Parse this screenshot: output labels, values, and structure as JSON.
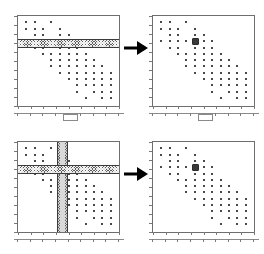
{
  "figure": {
    "title": "",
    "panel_count": 4,
    "arrow_count": 2
  },
  "chart_data": {
    "type": "scatter",
    "title": "",
    "xlabel": "",
    "ylabel": "",
    "xlim": [
      0,
      100
    ],
    "ylim": [
      0,
      100
    ],
    "grid": false,
    "legend": "none",
    "x_ticks": [
      0,
      12.5,
      25,
      37.5,
      50,
      62.5,
      75,
      87.5,
      100
    ],
    "y_ticks": [
      0,
      10,
      20,
      30,
      40,
      50,
      60,
      70,
      80,
      90,
      100
    ],
    "x_tick_labels": [
      "",
      "",
      "",
      "",
      "",
      "",
      "",
      "",
      ""
    ],
    "y_tick_labels": [
      "",
      "",
      "",
      "",
      "",
      "",
      "",
      "",
      "",
      "",
      ""
    ],
    "marker": "square",
    "marker_color": "#4a4a4a",
    "highlight_color": "#3a3a3a",
    "points": [
      [
        8,
        93
      ],
      [
        17,
        93
      ],
      [
        33,
        93
      ],
      [
        8,
        86
      ],
      [
        17,
        86
      ],
      [
        25,
        86
      ],
      [
        42,
        86
      ],
      [
        17,
        79
      ],
      [
        25,
        79
      ],
      [
        42,
        79
      ],
      [
        50,
        79
      ],
      [
        8,
        72
      ],
      [
        17,
        72
      ],
      [
        25,
        72
      ],
      [
        33,
        72
      ],
      [
        42,
        72
      ],
      [
        50,
        72
      ],
      [
        58,
        72
      ],
      [
        17,
        65
      ],
      [
        25,
        65
      ],
      [
        42,
        65
      ],
      [
        50,
        65
      ],
      [
        58,
        65
      ],
      [
        25,
        58
      ],
      [
        33,
        58
      ],
      [
        42,
        58
      ],
      [
        50,
        58
      ],
      [
        58,
        58
      ],
      [
        67,
        58
      ],
      [
        33,
        51
      ],
      [
        42,
        51
      ],
      [
        50,
        51
      ],
      [
        58,
        51
      ],
      [
        67,
        51
      ],
      [
        75,
        51
      ],
      [
        33,
        44
      ],
      [
        42,
        44
      ],
      [
        50,
        44
      ],
      [
        58,
        44
      ],
      [
        67,
        44
      ],
      [
        75,
        44
      ],
      [
        83,
        44
      ],
      [
        42,
        37
      ],
      [
        50,
        37
      ],
      [
        58,
        37
      ],
      [
        67,
        37
      ],
      [
        75,
        37
      ],
      [
        83,
        37
      ],
      [
        92,
        37
      ],
      [
        50,
        30
      ],
      [
        58,
        30
      ],
      [
        67,
        30
      ],
      [
        75,
        30
      ],
      [
        83,
        30
      ],
      [
        92,
        30
      ],
      [
        58,
        23
      ],
      [
        67,
        23
      ],
      [
        75,
        23
      ],
      [
        83,
        23
      ],
      [
        92,
        23
      ],
      [
        58,
        16
      ],
      [
        75,
        16
      ],
      [
        83,
        16
      ],
      [
        92,
        16
      ],
      [
        67,
        9
      ],
      [
        83,
        9
      ],
      [
        92,
        9
      ]
    ],
    "highlighted_point": [
      42,
      72
    ],
    "selection_bands": {
      "horizontal": {
        "y_center": 72,
        "y_min": 69,
        "y_max": 75,
        "label": "y-band"
      },
      "vertical": {
        "x_center": 42,
        "x_min": 38,
        "x_max": 46,
        "label": "x-band"
      }
    }
  },
  "panels": [
    {
      "id": "top-left",
      "name": "source-scatter-y-brush",
      "caption": "",
      "bands": [
        "horizontal"
      ],
      "has_highlight": false,
      "has_slider": true
    },
    {
      "id": "top-right",
      "name": "result-scatter-y-brush",
      "caption": "",
      "bands": [],
      "has_highlight": true,
      "has_slider": true
    },
    {
      "id": "bottom-left",
      "name": "source-scatter-xy-brush",
      "caption": "",
      "bands": [
        "horizontal",
        "vertical"
      ],
      "has_highlight": false,
      "has_slider": false
    },
    {
      "id": "bottom-right",
      "name": "result-scatter-xy-brush",
      "caption": "",
      "bands": [],
      "has_highlight": true,
      "has_slider": false
    }
  ],
  "controls": {
    "slider_handle_label": "",
    "arrow_label": ""
  },
  "colors": {
    "frame": "#6e6e6e",
    "tick": "#7a7a7a",
    "point": "#4a4a4a",
    "band": "#5f5f5f",
    "band_border": "#3b3b3b",
    "band_core": "#d9d9d9",
    "arrow": "#000000",
    "background": "#ffffff"
  }
}
